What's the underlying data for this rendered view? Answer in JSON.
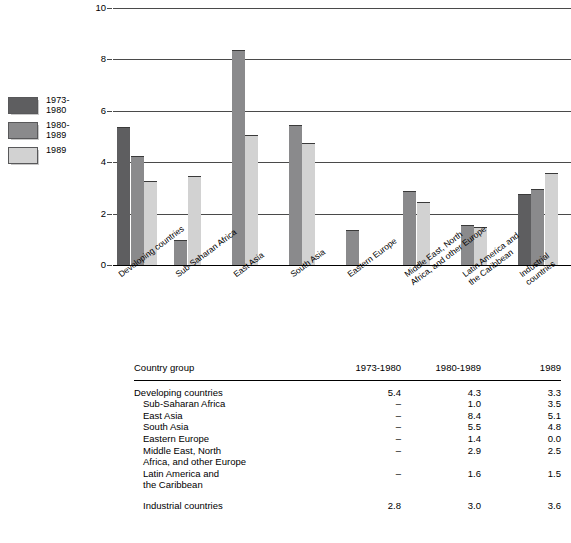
{
  "chart_data": {
    "type": "bar",
    "title": "",
    "xlabel": "",
    "ylabel": "",
    "ylim": [
      0,
      10
    ],
    "yticks": [
      "0",
      "2",
      "4",
      "6",
      "8",
      "10"
    ],
    "grid": true,
    "legend_position": "left",
    "categories": [
      "Developing countries",
      "Sub-Saharan Africa",
      "East Asia",
      "South Asia",
      "Eastern Europe",
      "Middle East, North\nAfrica, and other Europe",
      "Latin America and\nthe Caribbean",
      "Industrial countries"
    ],
    "series": [
      {
        "name": "1973-\n1980",
        "color": "#5e5e60",
        "values": [
          5.4,
          null,
          null,
          null,
          null,
          null,
          null,
          2.8
        ]
      },
      {
        "name": "1980-\n1989",
        "color": "#8a8a8c",
        "values": [
          4.3,
          1.0,
          8.4,
          5.5,
          1.4,
          2.9,
          1.6,
          3.0
        ]
      },
      {
        "name": "1989",
        "color": "#d2d2d2",
        "values": [
          3.3,
          3.5,
          5.1,
          4.8,
          0.0,
          2.5,
          1.5,
          3.6
        ]
      }
    ]
  },
  "legend": {
    "items": [
      {
        "label": "1973-\n1980"
      },
      {
        "label": "1980-\n1989"
      },
      {
        "label": "1989"
      }
    ]
  },
  "table": {
    "headers": {
      "group": "Country group",
      "col1": "1973-1980",
      "col2": "1980-1989",
      "col3": "1989"
    },
    "rows": [
      {
        "group": "Developing countries",
        "indent": 0,
        "gap_before": false,
        "col1": "5.4",
        "col2": "4.3",
        "col3": "3.3"
      },
      {
        "group": "Sub-Saharan Africa",
        "indent": 1,
        "gap_before": false,
        "col1": "–",
        "col2": "1.0",
        "col3": "3.5"
      },
      {
        "group": "East Asia",
        "indent": 1,
        "gap_before": false,
        "col1": "–",
        "col2": "8.4",
        "col3": "5.1"
      },
      {
        "group": "South Asia",
        "indent": 1,
        "gap_before": false,
        "col1": "–",
        "col2": "5.5",
        "col3": "4.8"
      },
      {
        "group": "Eastern Europe",
        "indent": 1,
        "gap_before": false,
        "col1": "–",
        "col2": "1.4",
        "col3": "0.0"
      },
      {
        "group": "Middle East, North\n Africa, and other Europe",
        "indent": 1,
        "gap_before": false,
        "col1": "–",
        "col2": "2.9",
        "col3": "2.5"
      },
      {
        "group": "Latin America and\n the Caribbean",
        "indent": 1,
        "gap_before": false,
        "col1": "–",
        "col2": "1.6",
        "col3": "1.5"
      },
      {
        "group": "Industrial countries",
        "indent": 1,
        "gap_before": true,
        "col1": "2.8",
        "col2": "3.0",
        "col3": "3.6"
      }
    ]
  },
  "caption": ""
}
